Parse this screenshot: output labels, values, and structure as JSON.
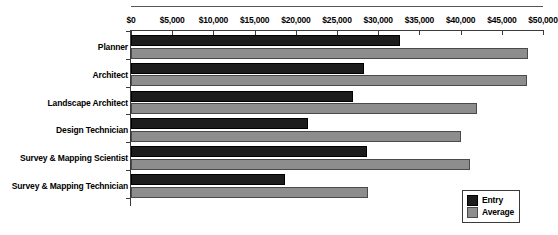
{
  "chart_data": {
    "type": "bar",
    "orientation": "horizontal",
    "title": "",
    "xlabel": "",
    "ylabel": "",
    "xlim": [
      0,
      50000
    ],
    "grid": false,
    "legend_position": "bottom-right",
    "categories": [
      "Planner",
      "Architect",
      "Landscape Architect",
      "Design Technician",
      "Survey & Mapping Scientist",
      "Survey & Mapping Technician"
    ],
    "tick_labels": [
      "$0",
      "$5,000",
      "$10,000",
      "$15,000",
      "$20,000",
      "$25,000",
      "$30,000",
      "$35,000",
      "$40,000",
      "$45,000",
      "$50,000"
    ],
    "tick_values": [
      0,
      5000,
      10000,
      15000,
      20000,
      25000,
      30000,
      35000,
      40000,
      45000,
      50000
    ],
    "series": [
      {
        "name": "Entry",
        "color": "#1c1c1c",
        "values": [
          32600,
          28300,
          27000,
          21500,
          28600,
          18700
        ]
      },
      {
        "name": "Average",
        "color": "#8d8d8d",
        "values": [
          48200,
          48000,
          42000,
          40000,
          41200,
          28800
        ]
      }
    ]
  },
  "legend": {
    "entries": [
      {
        "label": "Entry"
      },
      {
        "label": "Average"
      }
    ]
  },
  "colors": {
    "entry": "#1c1c1c",
    "average": "#8d8d8d",
    "axis": "#3a3a3a",
    "background": "#ffffff"
  }
}
